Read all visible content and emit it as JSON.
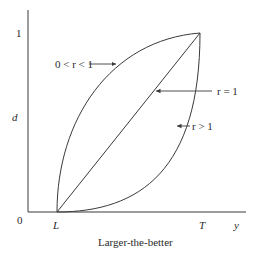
{
  "diagram": {
    "caption": "Larger-the-better",
    "y_axis": {
      "label": "d",
      "tick_top": "1",
      "origin": "0"
    },
    "x_axis": {
      "label": "y",
      "tick_L": "L",
      "tick_T": "T"
    },
    "curves": [
      {
        "id": "concave",
        "annotation": "0 < r < 1"
      },
      {
        "id": "linear",
        "annotation": "r = 1"
      },
      {
        "id": "convex",
        "annotation": "r > 1"
      }
    ],
    "colors": {
      "line": "#3a3a3a",
      "text": "#2a2a2a",
      "background": "#ffffff"
    }
  }
}
